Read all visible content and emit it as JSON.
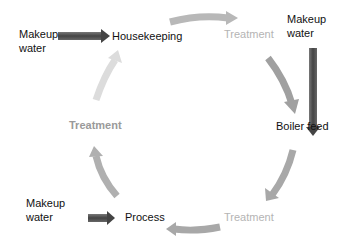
{
  "diagram": {
    "type": "water-reuse-cycle",
    "nodes": [
      {
        "id": "housekeeping",
        "label": "Housekeeping"
      },
      {
        "id": "treatment_top",
        "label": "Treatment"
      },
      {
        "id": "boiler_feed",
        "label": "Boiler feed"
      },
      {
        "id": "treatment_bottom",
        "label": "Treatment"
      },
      {
        "id": "process",
        "label": "Process"
      },
      {
        "id": "treatment_left",
        "label": "Treatment"
      }
    ],
    "inputs": [
      {
        "line1": "Makeup",
        "line2": "water",
        "target": "housekeeping"
      },
      {
        "line1": "Makeup",
        "line2": "water",
        "target": "boiler_feed"
      },
      {
        "line1": "Makeup",
        "line2": "water",
        "target": "process"
      }
    ],
    "flow_order": [
      "housekeeping",
      "treatment_top",
      "boiler_feed",
      "treatment_bottom",
      "process",
      "treatment_left",
      "housekeeping"
    ],
    "colors": {
      "makeup_arrow": "#555555",
      "cycle_arrow_dark": "#a0a0a0",
      "cycle_arrow_light": "#d6d6d6",
      "label_dark": "#111111",
      "label_light": "#b4b4b4"
    }
  }
}
